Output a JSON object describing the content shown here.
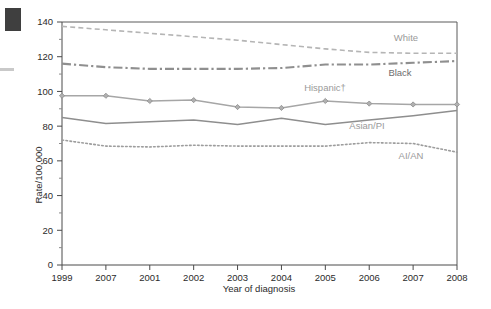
{
  "chart_data": {
    "type": "line",
    "title": "",
    "xlabel": "Year of diagnosis",
    "ylabel": "Rate/100,000",
    "x": [
      "1999",
      "2007",
      "2001",
      "2002",
      "2003",
      "2004",
      "2005",
      "2006",
      "2007",
      "2008"
    ],
    "categories": [
      "1999",
      "2007",
      "2001",
      "2002",
      "2003",
      "2004",
      "2005",
      "2006",
      "2007",
      "2008"
    ],
    "ylim": [
      0,
      140
    ],
    "xlim": [
      1999,
      2008
    ],
    "ytick_labels": [
      "0",
      "20",
      "40",
      "60",
      "80",
      "100",
      "120",
      "140"
    ],
    "ytick_values": [
      0,
      20,
      40,
      60,
      80,
      100,
      120,
      140
    ],
    "yminor_step": 10,
    "grid": false,
    "legend": "inline-annotations",
    "series": [
      {
        "name": "White",
        "style": "dashed",
        "color": "#b5b5b5",
        "markers": false,
        "values": [
          137.5,
          135.5,
          133.5,
          131.5,
          129.5,
          127.0,
          124.5,
          122.5,
          122.0,
          122.0
        ]
      },
      {
        "name": "Black",
        "style": "dash-dot",
        "color": "#8f8f8f",
        "markers": false,
        "values": [
          116.0,
          114.0,
          113.0,
          113.0,
          113.0,
          113.5,
          115.5,
          115.5,
          116.5,
          117.5
        ]
      },
      {
        "name": "Hispanic†",
        "style": "solid-markers",
        "color": "#a6a6a6",
        "markers": true,
        "values": [
          97.5,
          97.5,
          94.5,
          95.0,
          91.0,
          90.5,
          94.5,
          93.0,
          92.5,
          92.5
        ]
      },
      {
        "name": "Asian/PI",
        "style": "solid",
        "color": "#8e8e8e",
        "markers": false,
        "values": [
          85.0,
          81.5,
          82.5,
          83.5,
          81.0,
          84.5,
          81.0,
          83.5,
          86.0,
          89.0
        ]
      },
      {
        "name": "AI/AN",
        "style": "dotted",
        "color": "#9d9d9d",
        "markers": false,
        "values": [
          72.0,
          68.5,
          68.0,
          69.0,
          68.5,
          68.5,
          68.5,
          70.5,
          70.0,
          65.0
        ]
      }
    ],
    "annotations": [
      {
        "text": "White",
        "x_px": 406,
        "y_px": 41
      },
      {
        "text": "Black",
        "x_px": 400,
        "y_px": 76
      },
      {
        "text": "Hispanic†",
        "x_px": 325,
        "y_px": 91
      },
      {
        "text": "Asian/PI",
        "x_px": 367,
        "y_px": 129
      },
      {
        "text": "AI/AN",
        "x_px": 411,
        "y_px": 159
      }
    ]
  },
  "axes": {
    "y_title": "Rate/100,000",
    "x_title": "Year of diagnosis"
  }
}
